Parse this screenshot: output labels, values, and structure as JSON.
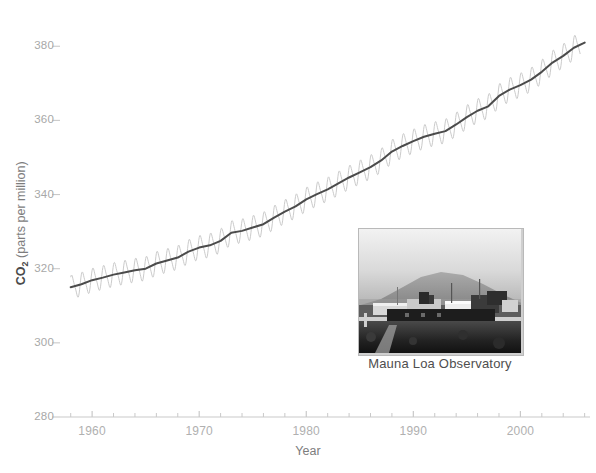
{
  "figure": {
    "clipped_header_text": "........ .......... ...... ....",
    "background_color": "#ffffff"
  },
  "inset": {
    "caption": "Mauna Loa Observatory",
    "alt_name": "mauna-loa-observatory-photo"
  },
  "chart_data": {
    "type": "line",
    "title": "",
    "xlabel": "Year",
    "ylabel": "CO₂ (parts per million)",
    "ylabel_prefix": "CO",
    "ylabel_subscript": "2",
    "ylabel_suffix": " (parts per million)",
    "xlim": [
      1957.0,
      2006.5
    ],
    "ylim": [
      280,
      386
    ],
    "grid": false,
    "legend": null,
    "xticks": [
      1960,
      1970,
      1980,
      1990,
      2000
    ],
    "xtick_labels": [
      "1960",
      "1970",
      "1980",
      "1990",
      "2000"
    ],
    "xminor_tick_interval": 2,
    "yticks": [
      280,
      300,
      320,
      340,
      360,
      380
    ],
    "ytick_labels": [
      "280",
      "300",
      "320",
      "340",
      "360",
      "380"
    ],
    "series": [
      {
        "name": "Monthly mean CO2 (seasonal cycle)",
        "color": "#c4c4c4",
        "line_width": 0.9,
        "seasonal_amplitude_ppm": 3.0,
        "description": "Monthly atmospheric CO2 showing annual sawtooth oscillation"
      },
      {
        "name": "Smoothed annual trend",
        "color": "#4b4b4b",
        "line_width": 2.0,
        "x": [
          1958,
          1959,
          1960,
          1961,
          1962,
          1963,
          1964,
          1965,
          1966,
          1967,
          1968,
          1969,
          1970,
          1971,
          1972,
          1973,
          1974,
          1975,
          1976,
          1977,
          1978,
          1979,
          1980,
          1981,
          1982,
          1983,
          1984,
          1985,
          1986,
          1987,
          1988,
          1989,
          1990,
          1991,
          1992,
          1993,
          1994,
          1995,
          1996,
          1997,
          1998,
          1999,
          2000,
          2001,
          2002,
          2003,
          2004,
          2005,
          2006
        ],
        "values": [
          315.0,
          315.8,
          316.9,
          317.6,
          318.4,
          319.0,
          319.6,
          320.0,
          321.4,
          322.2,
          323.0,
          324.6,
          325.7,
          326.3,
          327.5,
          329.7,
          330.2,
          331.1,
          332.0,
          333.8,
          335.4,
          336.8,
          338.7,
          340.1,
          341.4,
          343.0,
          344.6,
          346.0,
          347.4,
          349.2,
          351.6,
          353.1,
          354.4,
          355.6,
          356.4,
          357.1,
          358.9,
          360.9,
          362.6,
          363.8,
          366.6,
          368.3,
          369.5,
          371.0,
          373.1,
          375.6,
          377.4,
          379.6,
          381.0
        ]
      }
    ],
    "axis_color": "#c9c9c9",
    "tick_label_color": "#aeaeae"
  }
}
